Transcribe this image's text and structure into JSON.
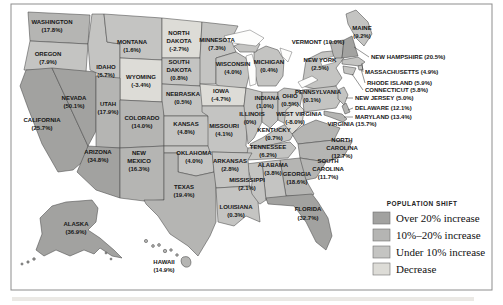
{
  "figure": {
    "background": "#fdfdfc",
    "frame_color": "#8d8d8d"
  },
  "legend": {
    "title": "POPULATION SHIFT",
    "items": [
      {
        "key": "over20",
        "label": "Over 20% increase",
        "color": "#a2a2a0"
      },
      {
        "key": "10to20",
        "label": "10%–20% increase",
        "color": "#b5b5b3"
      },
      {
        "key": "under10",
        "label": "Under 10% increase",
        "color": "#c4c4c2"
      },
      {
        "key": "decrease",
        "label": "Decrease",
        "color": "#dddcd7"
      }
    ]
  },
  "states": {
    "washington": {
      "name": "WASHINGTON",
      "value": "(17.8%)",
      "category": "10to20",
      "lines": [
        "WASHINGTON",
        "(17.8%)"
      ]
    },
    "oregon": {
      "name": "OREGON",
      "value": "(7.9%)",
      "category": "under10",
      "lines": [
        "OREGON",
        "(7.9%)"
      ]
    },
    "california": {
      "name": "CALIFORNIA",
      "value": "(25.7%)",
      "category": "over20",
      "lines": [
        "CALIFORNIA",
        "(25.7%)"
      ]
    },
    "nevada": {
      "name": "NEVADA",
      "value": "(50.1%)",
      "category": "over20",
      "lines": [
        "NEVADA",
        "(50.1%)"
      ]
    },
    "idaho": {
      "name": "IDAHO",
      "value": "(6.7%)",
      "category": "under10",
      "lines": [
        "IDAHO",
        "(6.7%)"
      ]
    },
    "montana": {
      "name": "MONTANA",
      "value": "(1.6%)",
      "category": "under10",
      "lines": [
        "MONTANA",
        "(1.6%)"
      ]
    },
    "wyoming": {
      "name": "WYOMING",
      "value": "(-3.4%)",
      "category": "decrease",
      "lines": [
        "WYOMING",
        "(-3.4%)"
      ]
    },
    "utah": {
      "name": "UTAH",
      "value": "(17.9%)",
      "category": "10to20",
      "lines": [
        "UTAH",
        "(17.9%)"
      ]
    },
    "colorado": {
      "name": "COLORADO",
      "value": "(14.0%)",
      "category": "10to20",
      "lines": [
        "COLORADO",
        "(14.0%)"
      ]
    },
    "arizona": {
      "name": "ARIZONA",
      "value": "(34.8%)",
      "category": "over20",
      "lines": [
        "ARIZONA",
        "(34.8%)"
      ]
    },
    "new_mexico": {
      "name": "NEW MEXICO",
      "value": "(16.3%)",
      "category": "10to20",
      "lines": [
        "NEW",
        "MEXICO",
        "(16.3%)"
      ]
    },
    "north_dakota": {
      "name": "NORTH DAKOTA",
      "value": "(-2.7%)",
      "category": "decrease",
      "lines": [
        "NORTH",
        "DAKOTA",
        "(-2.7%)"
      ]
    },
    "south_dakota": {
      "name": "SOUTH DAKOTA",
      "value": "(0.8%)",
      "category": "under10",
      "lines": [
        "SOUTH",
        "DAKOTA",
        "(0.8%)"
      ]
    },
    "nebraska": {
      "name": "NEBRASKA",
      "value": "(0.5%)",
      "category": "under10",
      "lines": [
        "NEBRASKA",
        "(0.5%)"
      ]
    },
    "kansas": {
      "name": "KANSAS",
      "value": "(4.8%)",
      "category": "under10",
      "lines": [
        "KANSAS",
        "(4.8%)"
      ]
    },
    "oklahoma": {
      "name": "OKLAHOMA",
      "value": "(4.0%)",
      "category": "under10",
      "lines": [
        "OKLAHOMA",
        "(4.0%)"
      ]
    },
    "texas": {
      "name": "TEXAS",
      "value": "(19.4%)",
      "category": "10to20",
      "lines": [
        "TEXAS",
        "(19.4%)"
      ]
    },
    "minnesota": {
      "name": "MINNESOTA",
      "value": "(7.3%)",
      "category": "under10",
      "lines": [
        "MINNESOTA",
        "(7.3%)"
      ]
    },
    "iowa": {
      "name": "IOWA",
      "value": "(-4.7%)",
      "category": "decrease",
      "lines": [
        "IOWA",
        "(-4.7%)"
      ]
    },
    "missouri": {
      "name": "MISSOURI",
      "value": "(4.1%)",
      "category": "under10",
      "lines": [
        "MISSOURI",
        "(4.1%)"
      ]
    },
    "arkansas": {
      "name": "ARKANSAS",
      "value": "(2.8%)",
      "category": "under10",
      "lines": [
        "ARKANSAS",
        "(2.8%)"
      ]
    },
    "louisiana": {
      "name": "LOUISIANA",
      "value": "(0.3%)",
      "category": "under10",
      "lines": [
        "LOUISIANA",
        "(0.3%)"
      ]
    },
    "wisconsin": {
      "name": "WISCONSIN",
      "value": "(4.0%)",
      "category": "under10",
      "lines": [
        "WISCONSIN",
        "(4.0%)"
      ]
    },
    "illinois": {
      "name": "ILLINOIS",
      "value": "(0%)",
      "category": "under10",
      "lines": [
        "ILLINOIS",
        "(0%)"
      ]
    },
    "michigan": {
      "name": "MICHIGAN",
      "value": "(0.4%)",
      "category": "under10",
      "lines": [
        "MICHIGAN",
        "(0.4%)"
      ]
    },
    "indiana": {
      "name": "INDIANA",
      "value": "(1.0%)",
      "category": "under10",
      "lines": [
        "INDIANA",
        "(1.0%)"
      ]
    },
    "ohio": {
      "name": "OHIO",
      "value": "(0.5%)",
      "category": "under10",
      "lines": [
        "OHIO",
        "(0.5%)"
      ]
    },
    "kentucky": {
      "name": "KENTUCKY",
      "value": "(0.7%)",
      "category": "under10",
      "lines": [
        "KENTUCKY",
        "(0.7%)"
      ]
    },
    "tennessee": {
      "name": "TENNESSEE",
      "value": "(6.2%)",
      "category": "under10",
      "lines": [
        "TENNESSEE",
        "(6.2%)"
      ]
    },
    "mississippi": {
      "name": "MISSISSIPPI",
      "value": "(2.1%)",
      "category": "under10",
      "lines": [
        "MISSISSIPPI",
        "(2.1%)"
      ]
    },
    "alabama": {
      "name": "ALABAMA",
      "value": "(3.8%)",
      "category": "under10",
      "lines": [
        "ALABAMA",
        "(3.8%)"
      ]
    },
    "georgia": {
      "name": "GEORGIA",
      "value": "(18.6%)",
      "category": "10to20",
      "lines": [
        "GEORGIA",
        "(18.6%)"
      ]
    },
    "florida": {
      "name": "FLORIDA",
      "value": "(32.7%)",
      "category": "over20",
      "lines": [
        "FLORIDA",
        "(32.7%)"
      ]
    },
    "south_carolina": {
      "name": "SOUTH CAROLINA",
      "value": "(11.7%)",
      "category": "10to20",
      "lines": [
        "SOUTH",
        "CAROLINA",
        "(11.7%)"
      ]
    },
    "north_carolina": {
      "name": "NORTH CAROLINA",
      "value": "(12.7%)",
      "category": "10to20",
      "lines": [
        "NORTH",
        "CAROLINA",
        "(12.7%)"
      ]
    },
    "virginia": {
      "name": "VIRGINIA",
      "value": "(15.7%)",
      "category": "10to20",
      "lines": [
        "VIRGINIA (15.7%)"
      ]
    },
    "west_virginia": {
      "name": "WEST VIRGINIA",
      "value": "(-8.0%)",
      "category": "decrease",
      "lines": [
        "WEST VIRGINIA",
        "(-8.0%)"
      ]
    },
    "vermont": {
      "name": "VERMONT",
      "value": "(10.0%)",
      "category": "10to20",
      "lines": [
        "VERMONT (10.0%)"
      ]
    },
    "maine": {
      "name": "MAINE",
      "value": "(9.2%)",
      "category": "under10",
      "lines": [
        "MAINE",
        "(9.2%)"
      ]
    },
    "new_hampshire": {
      "name": "NEW HAMPSHIRE",
      "value": "(20.5%)",
      "category": "over20",
      "lines": [
        "NEW HAMPSHIRE (20.5%)"
      ]
    },
    "massachusetts": {
      "name": "MASSACHUSETTS",
      "value": "(4.9%)",
      "category": "under10",
      "lines": [
        "MASSACHUSETTS (4.9%)"
      ]
    },
    "rhode_island": {
      "name": "RHODE ISLAND",
      "value": "(5.9%)",
      "category": "under10",
      "lines": [
        "RHODE ISLAND (5.9%)"
      ]
    },
    "connecticut": {
      "name": "CONNECTICUT",
      "value": "(5.8%)",
      "category": "under10",
      "lines": [
        "CONNECTICUT (5.8%)"
      ]
    },
    "new_jersey": {
      "name": "NEW JERSEY",
      "value": "(5.0%)",
      "category": "under10",
      "lines": [
        "NEW JERSEY (5.0%)"
      ]
    },
    "delaware": {
      "name": "DELAWARE",
      "value": "(12.1%)",
      "category": "10to20",
      "lines": [
        "DELAWARE (12.1%)"
      ]
    },
    "maryland": {
      "name": "MARYLAND",
      "value": "(13.4%)",
      "category": "10to20",
      "lines": [
        "MARYLAND (13.4%)"
      ]
    },
    "new_york": {
      "name": "NEW YORK",
      "value": "(2.5%)",
      "category": "under10",
      "lines": [
        "NEW YORK",
        "(2.5%)"
      ]
    },
    "pennsylvania": {
      "name": "PENNSYLVANIA",
      "value": "(0.1%)",
      "category": "under10",
      "lines": [
        "PENNSYLVANIA",
        "(0.1%)"
      ]
    },
    "alaska": {
      "name": "ALASKA",
      "value": "(36.9%)",
      "category": "over20",
      "lines": [
        "ALASKA",
        "(36.9%)"
      ]
    },
    "hawaii": {
      "name": "HAWAII",
      "value": "(14.9%)",
      "category": "10to20",
      "lines": [
        "HAWAII",
        "(14.9%)"
      ]
    }
  }
}
